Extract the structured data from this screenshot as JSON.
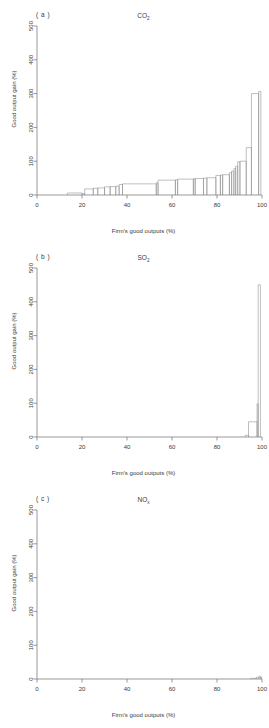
{
  "figure": {
    "background": "#ffffff",
    "line_color": "#8a8a8a",
    "axis_color": "#6f6f6f",
    "width": 269,
    "height": 728
  },
  "axis": {
    "xlabel": "Firm's good outputs (%)",
    "ylabel": "Good output gain (%)",
    "xticks": [
      "0",
      "20",
      "40",
      "60",
      "80",
      "100"
    ],
    "yticks": [
      "0",
      "100",
      "200",
      "300",
      "400",
      "500"
    ]
  },
  "panels": [
    {
      "label": "( a )",
      "title_main": "CO",
      "title_sub": "2"
    },
    {
      "label": "( b )",
      "title_main": "SO",
      "title_sub": "2"
    },
    {
      "label": "( c )",
      "title_main": "NO",
      "title_sub": "x"
    }
  ],
  "chart_data": [
    {
      "type": "bar",
      "panel": "a",
      "title": "CO2",
      "xlabel": "Firm's good outputs (%)",
      "ylabel": "Good output gain (%)",
      "xlim": [
        0,
        100
      ],
      "ylim": [
        0,
        500
      ],
      "grid": false,
      "legend": "none",
      "note": "Step histogram: bars defined by [x_start, x_end, height] in data units",
      "bars": [
        [
          13.5,
          20.0,
          6
        ],
        [
          20.0,
          21.2,
          4
        ],
        [
          21.2,
          25.0,
          18
        ],
        [
          25.0,
          27.0,
          20
        ],
        [
          27.0,
          30.0,
          21
        ],
        [
          30.0,
          32.5,
          24
        ],
        [
          32.5,
          35.0,
          25
        ],
        [
          35.0,
          36.5,
          26
        ],
        [
          36.5,
          38.0,
          31
        ],
        [
          38.0,
          53.0,
          33
        ],
        [
          53.0,
          53.8,
          36
        ],
        [
          53.8,
          61.5,
          44
        ],
        [
          61.5,
          62.5,
          45
        ],
        [
          62.5,
          69.5,
          47
        ],
        [
          69.5,
          70.3,
          48
        ],
        [
          70.3,
          74.0,
          49
        ],
        [
          74.0,
          75.5,
          50
        ],
        [
          75.5,
          79.5,
          51
        ],
        [
          79.5,
          81.5,
          58
        ],
        [
          81.5,
          82.5,
          59
        ],
        [
          82.5,
          85.5,
          60
        ],
        [
          85.5,
          86.5,
          66
        ],
        [
          86.5,
          87.5,
          71
        ],
        [
          87.5,
          88.3,
          78
        ],
        [
          88.3,
          89.2,
          85
        ],
        [
          89.2,
          90.2,
          98
        ],
        [
          90.2,
          93.0,
          100
        ],
        [
          93.0,
          95.3,
          140
        ],
        [
          95.3,
          98.5,
          300
        ],
        [
          98.5,
          99.5,
          306
        ]
      ]
    },
    {
      "type": "bar",
      "panel": "b",
      "title": "SO2",
      "xlabel": "Firm's good outputs (%)",
      "ylabel": "Good output gain (%)",
      "xlim": [
        0,
        100
      ],
      "ylim": [
        0,
        500
      ],
      "grid": false,
      "legend": "none",
      "bars": [
        [
          92.5,
          94.0,
          5
        ],
        [
          94.0,
          97.8,
          45
        ],
        [
          97.8,
          98.3,
          98
        ],
        [
          98.3,
          99.3,
          450
        ]
      ]
    },
    {
      "type": "bar",
      "panel": "c",
      "title": "NOx",
      "xlabel": "Firm's good outputs (%)",
      "ylabel": "Good output gain (%)",
      "xlim": [
        0,
        100
      ],
      "ylim": [
        0,
        500
      ],
      "grid": false,
      "legend": "none",
      "bars": [
        [
          95.0,
          97.5,
          2
        ],
        [
          97.5,
          98.6,
          5
        ],
        [
          98.6,
          99.3,
          8
        ],
        [
          99.3,
          99.8,
          6
        ]
      ]
    }
  ]
}
